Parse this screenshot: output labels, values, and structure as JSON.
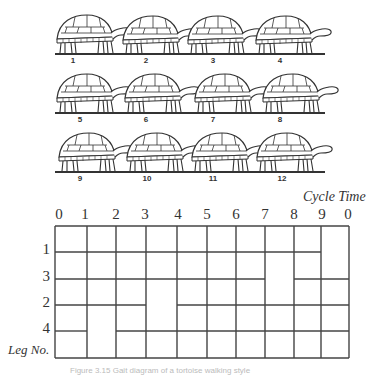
{
  "figure": {
    "turtles": [
      {
        "label": "1"
      },
      {
        "label": "2"
      },
      {
        "label": "3"
      },
      {
        "label": "4"
      },
      {
        "label": "5"
      },
      {
        "label": "6"
      },
      {
        "label": "7"
      },
      {
        "label": "8"
      },
      {
        "label": "9"
      },
      {
        "label": "10"
      },
      {
        "label": "11"
      },
      {
        "label": "12"
      }
    ],
    "gait_diagram": {
      "title": "Cycle Time",
      "ticks": [
        "0",
        "1",
        "2",
        "3",
        "4",
        "5",
        "6",
        "7",
        "8",
        "9",
        "0"
      ],
      "row_axis_label": "Leg No.",
      "rows": [
        {
          "leg": "1",
          "lifted_intervals": [
            [
              9,
              10
            ]
          ]
        },
        {
          "leg": "3",
          "lifted_intervals": [
            [
              7,
              8
            ]
          ]
        },
        {
          "leg": "2",
          "lifted_intervals": [
            [
              3,
              4
            ]
          ]
        },
        {
          "leg": "4",
          "lifted_intervals": [
            [
              1,
              2
            ]
          ]
        }
      ]
    },
    "caption": "Figure 3.15 Gait diagram of a tortoise walking style"
  }
}
